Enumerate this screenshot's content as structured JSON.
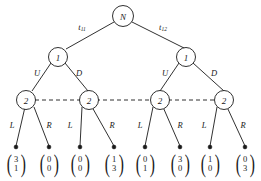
{
  "diagram": {
    "type": "binary-decision-tree",
    "depth": 4,
    "colors": {
      "stroke": "#1a1a1a",
      "node_fill": "#ffffff",
      "background": "#ffffff"
    },
    "root": {
      "label": "N",
      "edges": [
        {
          "label_base": "t",
          "label_sub": "11"
        },
        {
          "label_base": "t",
          "label_sub": "12"
        }
      ]
    },
    "level2": {
      "nodes": [
        {
          "label": "1"
        },
        {
          "label": "1"
        }
      ],
      "edge_labels": [
        "U",
        "D",
        "U",
        "D"
      ]
    },
    "level3": {
      "nodes": [
        {
          "label": "2"
        },
        {
          "label": "2"
        },
        {
          "label": "2"
        },
        {
          "label": "2"
        }
      ],
      "information_set": "dashed",
      "edge_labels": [
        "L",
        "R",
        "L",
        "R",
        "L",
        "R",
        "L",
        "R"
      ]
    },
    "leaves": [
      {
        "top": "3",
        "bottom": "1"
      },
      {
        "top": "0",
        "bottom": "0"
      },
      {
        "top": "0",
        "bottom": "0"
      },
      {
        "top": "1",
        "bottom": "3"
      },
      {
        "top": "0",
        "bottom": "1"
      },
      {
        "top": "3",
        "bottom": "0"
      },
      {
        "top": "1",
        "bottom": "0"
      },
      {
        "top": "0",
        "bottom": "3"
      }
    ]
  }
}
